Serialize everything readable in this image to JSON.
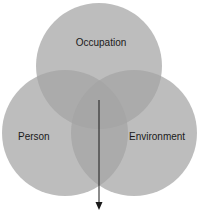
{
  "diagram": {
    "type": "venn",
    "circles": [
      {
        "label": "Occupation",
        "cx": 99,
        "cy": 66,
        "r": 63
      },
      {
        "label": "Person",
        "cx": 65,
        "cy": 133,
        "r": 63
      },
      {
        "label": "Environment",
        "cx": 134,
        "cy": 133,
        "r": 63
      }
    ],
    "labels": {
      "occupation": "Occupation",
      "person": "Person",
      "environment": "Environment"
    },
    "colors": {
      "circle_fill": "#9a9a9a",
      "circle_opacity": "0.75",
      "arrow": "#1a1a1a",
      "background": "#ffffff"
    },
    "arrow": {
      "x": 99,
      "y_start": 100,
      "y_end": 209
    }
  }
}
